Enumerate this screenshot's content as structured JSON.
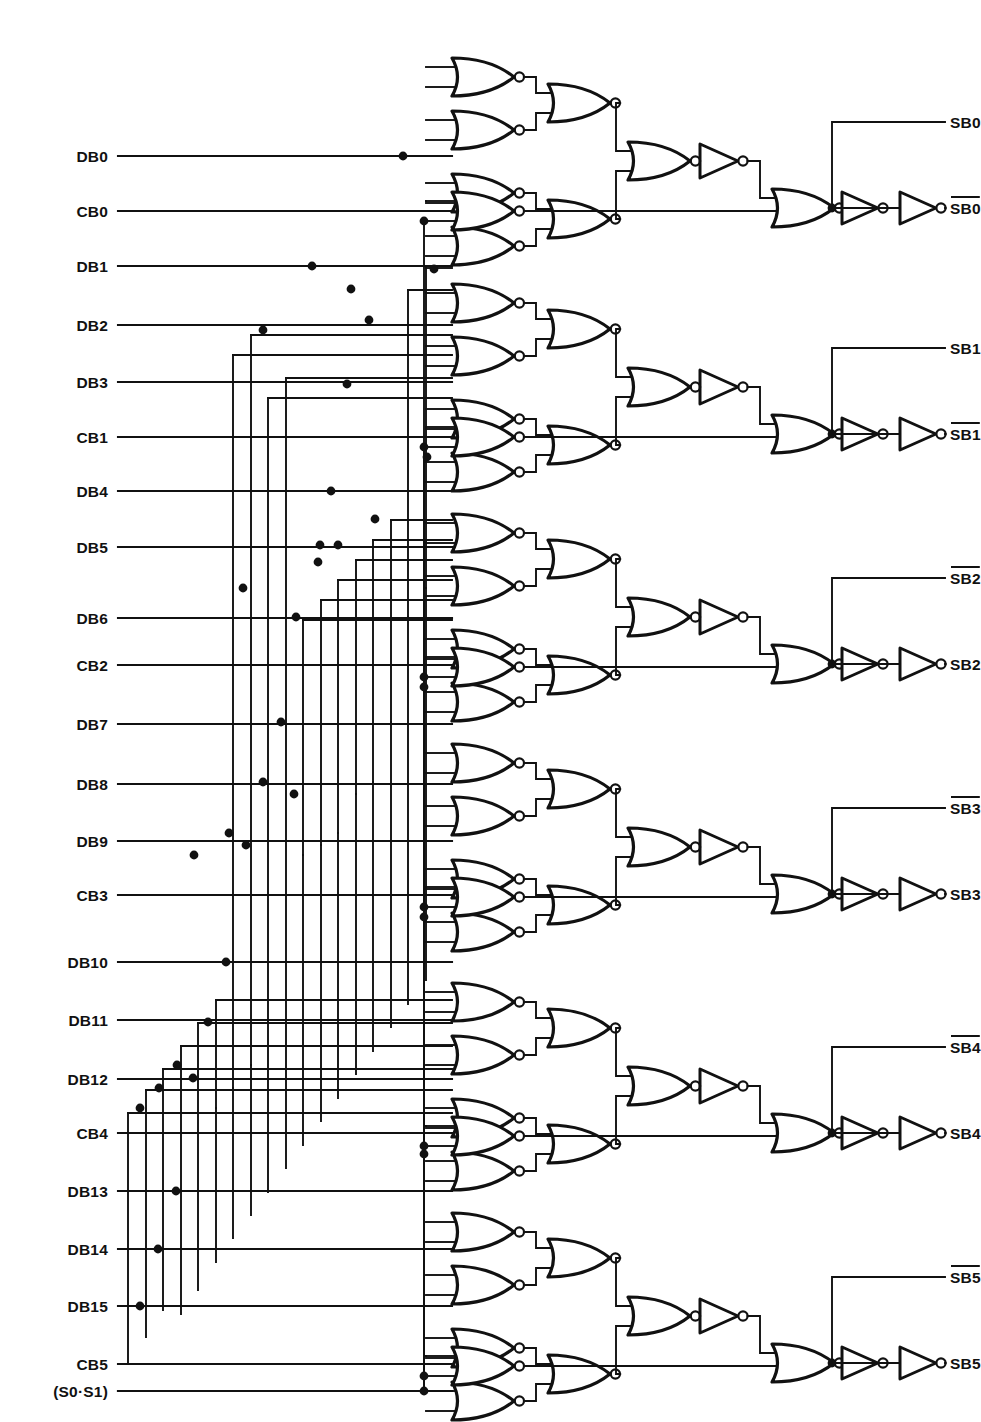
{
  "diagram": {
    "kind": "logic-schematic",
    "width": 981,
    "height": 1422,
    "line_color": "#111111",
    "background": "#ffffff"
  },
  "inputs": [
    {
      "id": "DB0",
      "label": "DB0",
      "y": 156,
      "kind": "data"
    },
    {
      "id": "CB0",
      "label": "CB0",
      "y": 211,
      "kind": "check"
    },
    {
      "id": "DB1",
      "label": "DB1",
      "y": 266,
      "kind": "data"
    },
    {
      "id": "DB2",
      "label": "DB2",
      "y": 325,
      "kind": "data"
    },
    {
      "id": "DB3",
      "label": "DB3",
      "y": 382,
      "kind": "data"
    },
    {
      "id": "CB1",
      "label": "CB1",
      "y": 437,
      "kind": "check"
    },
    {
      "id": "DB4",
      "label": "DB4",
      "y": 491,
      "kind": "data"
    },
    {
      "id": "DB5",
      "label": "DB5",
      "y": 547,
      "kind": "data"
    },
    {
      "id": "DB6",
      "label": "DB6",
      "y": 618,
      "kind": "data"
    },
    {
      "id": "CB2",
      "label": "CB2",
      "y": 665,
      "kind": "check"
    },
    {
      "id": "DB7",
      "label": "DB7",
      "y": 724,
      "kind": "data"
    },
    {
      "id": "DB8",
      "label": "DB8",
      "y": 784,
      "kind": "data"
    },
    {
      "id": "DB9",
      "label": "DB9",
      "y": 841,
      "kind": "data"
    },
    {
      "id": "CB3",
      "label": "CB3",
      "y": 895,
      "kind": "check"
    },
    {
      "id": "DB10",
      "label": "DB10",
      "y": 962,
      "kind": "data"
    },
    {
      "id": "DB11",
      "label": "DB11",
      "y": 1020,
      "kind": "data"
    },
    {
      "id": "DB12",
      "label": "DB12",
      "y": 1079,
      "kind": "data"
    },
    {
      "id": "CB4",
      "label": "CB4",
      "y": 1133,
      "kind": "check"
    },
    {
      "id": "DB13",
      "label": "DB13",
      "y": 1191,
      "kind": "data"
    },
    {
      "id": "DB14",
      "label": "DB14",
      "y": 1249,
      "kind": "data"
    },
    {
      "id": "DB15",
      "label": "DB15",
      "y": 1306,
      "kind": "data"
    },
    {
      "id": "CB5",
      "label": "CB5",
      "y": 1364,
      "kind": "check"
    },
    {
      "id": "S0S1",
      "label": "(S0·S1)",
      "y": 1391,
      "kind": "control"
    }
  ],
  "input_line": {
    "label_x": 108,
    "line_start_x": 118,
    "line_end_x": 452
  },
  "outputs": [
    {
      "group": 0,
      "top": {
        "label": "SB0",
        "overline": false,
        "y": 122
      },
      "bottom": {
        "label": "SB0",
        "overline": true,
        "y": 208
      }
    },
    {
      "group": 1,
      "top": {
        "label": "SB1",
        "overline": false,
        "y": 348
      },
      "bottom": {
        "label": "SB1",
        "overline": true,
        "y": 434
      }
    },
    {
      "group": 2,
      "top": {
        "label": "SB2",
        "overline": true,
        "y": 578
      },
      "bottom": {
        "label": "SB2",
        "overline": false,
        "y": 664
      }
    },
    {
      "group": 3,
      "top": {
        "label": "SB3",
        "overline": true,
        "y": 808
      },
      "bottom": {
        "label": "SB3",
        "overline": false,
        "y": 894
      }
    },
    {
      "group": 4,
      "top": {
        "label": "SB4",
        "overline": true,
        "y": 1047
      },
      "bottom": {
        "label": "SB4",
        "overline": false,
        "y": 1133
      }
    },
    {
      "group": 5,
      "top": {
        "label": "SB5",
        "overline": true,
        "y": 1277
      },
      "bottom": {
        "label": "SB5",
        "overline": false,
        "y": 1363
      }
    }
  ],
  "output_line": {
    "label_x": 900,
    "stub_start_x": 830,
    "branch_x": 832
  },
  "groups": [
    {
      "index": 0,
      "name": "syndrome-stage-sb0",
      "base_y": 55,
      "cb_y": 211,
      "cb_label": "CB0"
    },
    {
      "index": 1,
      "name": "syndrome-stage-sb1",
      "base_y": 281,
      "cb_y": 437,
      "cb_label": "CB1"
    },
    {
      "index": 2,
      "name": "syndrome-stage-sb2",
      "base_y": 511,
      "cb_y": 667,
      "cb_label": "CB2"
    },
    {
      "index": 3,
      "name": "syndrome-stage-sb3",
      "base_y": 741,
      "cb_y": 897,
      "cb_label": "CB3"
    },
    {
      "index": 4,
      "name": "syndrome-stage-sb4",
      "base_y": 980,
      "cb_y": 1136,
      "cb_label": "CB4"
    },
    {
      "index": 5,
      "name": "syndrome-stage-sb5",
      "base_y": 1210,
      "cb_y": 1366,
      "cb_label": "CB5"
    }
  ],
  "gate_counts": {
    "input_nor_gates_per_group": 4,
    "merge_nor_gates_per_group": 2,
    "combine_nor_gates_per_group": 1,
    "inverters_per_group": 3,
    "check_nor_gates_per_group": 1,
    "final_nor_gates_per_group": 1,
    "groups": 6,
    "total_gates": 72
  },
  "geometry": {
    "gate_x": 452,
    "gate_w": 62,
    "gate_h": 38,
    "stage2_x": 548,
    "stage3_x": 628,
    "inv1_x": 700,
    "drop_x": 760,
    "final_nor_x": 772,
    "inv2_x": 842,
    "inv3_x": 900
  },
  "bus_x": [
    128,
    146,
    163,
    181,
    198,
    216,
    233,
    251,
    268,
    286,
    303,
    321,
    338,
    356,
    373,
    391,
    408,
    426
  ],
  "junction_dots": [
    {
      "x": 403,
      "y": 156
    },
    {
      "x": 312,
      "y": 266
    },
    {
      "x": 351,
      "y": 289
    },
    {
      "x": 434,
      "y": 269
    },
    {
      "x": 263,
      "y": 330
    },
    {
      "x": 369,
      "y": 320
    },
    {
      "x": 347,
      "y": 384
    },
    {
      "x": 427,
      "y": 457
    },
    {
      "x": 331,
      "y": 491
    },
    {
      "x": 375,
      "y": 519
    },
    {
      "x": 320,
      "y": 545
    },
    {
      "x": 338,
      "y": 545
    },
    {
      "x": 318,
      "y": 562
    },
    {
      "x": 243,
      "y": 588
    },
    {
      "x": 296,
      "y": 617
    },
    {
      "x": 424,
      "y": 687
    },
    {
      "x": 281,
      "y": 722
    },
    {
      "x": 294,
      "y": 794
    },
    {
      "x": 263,
      "y": 782
    },
    {
      "x": 229,
      "y": 833
    },
    {
      "x": 246,
      "y": 845
    },
    {
      "x": 194,
      "y": 855
    },
    {
      "x": 424,
      "y": 917
    },
    {
      "x": 226,
      "y": 962
    },
    {
      "x": 208,
      "y": 1022
    },
    {
      "x": 177,
      "y": 1065
    },
    {
      "x": 193,
      "y": 1078
    },
    {
      "x": 159,
      "y": 1088
    },
    {
      "x": 140,
      "y": 1108
    },
    {
      "x": 424,
      "y": 1154
    },
    {
      "x": 176,
      "y": 1191
    },
    {
      "x": 158,
      "y": 1249
    },
    {
      "x": 140,
      "y": 1306
    },
    {
      "x": 424,
      "y": 1391
    }
  ]
}
